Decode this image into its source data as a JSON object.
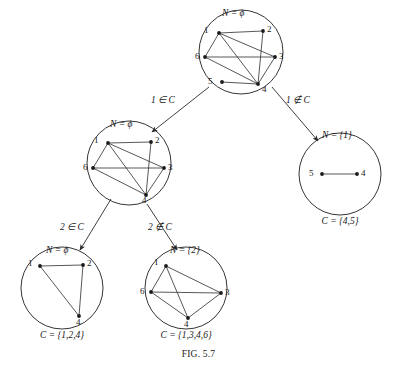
{
  "figure": {
    "caption_prefix": "F",
    "caption_rest": "IG",
    "caption_number": ". 5.7",
    "caption_full": "FIG. 5.7",
    "width": 397,
    "height": 370,
    "ink_color": "#1a1a1a",
    "circle_stroke": "#2a2a2a",
    "edge_color": "#3a3a3a"
  },
  "tree_nodes": [
    {
      "id": "root",
      "name": "root-subproblem",
      "center": [
        241,
        52
      ],
      "radius": 42,
      "n_label": "N = ϕ",
      "n_label_pos": [
        222,
        14
      ],
      "c_label": null,
      "c_label_pos": null,
      "graph": {
        "vertices": [
          {
            "id": "1",
            "pos": [
              219,
              33
            ],
            "label_pos": [
              209,
              30
            ],
            "label_anchor": "right"
          },
          {
            "id": "2",
            "pos": [
              263,
              31
            ],
            "label_pos": [
              267,
              29
            ],
            "label_anchor": "left"
          },
          {
            "id": "3",
            "pos": [
              275,
              57
            ],
            "label_pos": [
              279,
              56
            ],
            "label_anchor": "left"
          },
          {
            "id": "4",
            "pos": [
              258,
              84
            ],
            "label_pos": [
              262,
              89
            ],
            "label_anchor": "left"
          },
          {
            "id": "5",
            "pos": [
              222,
              82
            ],
            "label_pos": [
              213,
              81
            ],
            "label_anchor": "right"
          },
          {
            "id": "6",
            "pos": [
              205,
              57
            ],
            "label_pos": [
              200,
              56
            ],
            "label_anchor": "right"
          }
        ],
        "edges": [
          [
            "1",
            "2"
          ],
          [
            "1",
            "6"
          ],
          [
            "1",
            "4"
          ],
          [
            "1",
            "3"
          ],
          [
            "2",
            "4"
          ],
          [
            "6",
            "3"
          ],
          [
            "6",
            "4"
          ],
          [
            "3",
            "4"
          ],
          [
            "5",
            "4"
          ]
        ]
      }
    },
    {
      "id": "mid-left",
      "name": "subproblem-1-in-c",
      "center": [
        129,
        163
      ],
      "radius": 42,
      "n_label": "N = ϕ",
      "n_label_pos": [
        110,
        125
      ],
      "c_label": null,
      "c_label_pos": null,
      "graph": {
        "vertices": [
          {
            "id": "1",
            "pos": [
              108,
              143
            ],
            "label_pos": [
              99,
              140
            ],
            "label_anchor": "right"
          },
          {
            "id": "2",
            "pos": [
              151,
              142
            ],
            "label_pos": [
              155,
              140
            ],
            "label_anchor": "left"
          },
          {
            "id": "3",
            "pos": [
              164,
              168
            ],
            "label_pos": [
              168,
              167
            ],
            "label_anchor": "left"
          },
          {
            "id": "4",
            "pos": [
              146,
              195
            ],
            "label_pos": [
              142,
              200
            ],
            "label_anchor": "left"
          },
          {
            "id": "6",
            "pos": [
              93,
              168
            ],
            "label_pos": [
              88,
              167
            ],
            "label_anchor": "right"
          }
        ],
        "edges": [
          [
            "1",
            "2"
          ],
          [
            "1",
            "6"
          ],
          [
            "1",
            "4"
          ],
          [
            "1",
            "3"
          ],
          [
            "2",
            "4"
          ],
          [
            "6",
            "3"
          ],
          [
            "6",
            "4"
          ],
          [
            "3",
            "4"
          ]
        ]
      }
    },
    {
      "id": "right",
      "name": "subproblem-1-not-in-c",
      "center": [
        340,
        174
      ],
      "radius": 41,
      "n_label": "N = {1}",
      "n_label_pos": [
        322,
        136
      ],
      "c_label": "C = {4,5}",
      "c_label_pos": [
        340,
        222
      ],
      "graph": {
        "vertices": [
          {
            "id": "5",
            "pos": [
              322,
              174
            ],
            "label_pos": [
              314,
              173
            ],
            "label_anchor": "right"
          },
          {
            "id": "4",
            "pos": [
              357,
              174
            ],
            "label_pos": [
              361,
              173
            ],
            "label_anchor": "left"
          }
        ],
        "edges": [
          [
            "5",
            "4"
          ]
        ]
      }
    },
    {
      "id": "bottom-left",
      "name": "subproblem-2-in-c",
      "center": [
        62,
        288
      ],
      "radius": 41,
      "n_label": "N = ϕ",
      "n_label_pos": [
        46,
        251
      ],
      "c_label": "C = {1,2,4}",
      "c_label_pos": [
        62,
        336
      ],
      "graph": {
        "vertices": [
          {
            "id": "1",
            "pos": [
              40,
              266
            ],
            "label_pos": [
              33,
              263
            ],
            "label_anchor": "right"
          },
          {
            "id": "2",
            "pos": [
              83,
              265
            ],
            "label_pos": [
              87,
              263
            ],
            "label_anchor": "left"
          },
          {
            "id": "4",
            "pos": [
              79,
              316
            ],
            "label_pos": [
              76,
              322
            ],
            "label_anchor": "left"
          }
        ],
        "edges": [
          [
            "1",
            "2"
          ],
          [
            "1",
            "4"
          ],
          [
            "2",
            "4"
          ]
        ]
      }
    },
    {
      "id": "bottom-mid",
      "name": "subproblem-2-not-in-c",
      "center": [
        186,
        288
      ],
      "radius": 41,
      "n_label": "N = {2}",
      "n_label_pos": [
        170,
        251
      ],
      "c_label": "C = {1,3,4,6}",
      "c_label_pos": [
        186,
        336
      ],
      "graph": {
        "vertices": [
          {
            "id": "1",
            "pos": [
              166,
              266
            ],
            "label_pos": [
              159,
              262
            ],
            "label_anchor": "right"
          },
          {
            "id": "3",
            "pos": [
              221,
              293
            ],
            "label_pos": [
              225,
              292
            ],
            "label_anchor": "left"
          },
          {
            "id": "4",
            "pos": [
              188,
              318
            ],
            "label_pos": [
              184,
              324
            ],
            "label_anchor": "left"
          },
          {
            "id": "6",
            "pos": [
              151,
              292
            ],
            "label_pos": [
              145,
              291
            ],
            "label_anchor": "right"
          }
        ],
        "edges": [
          [
            "1",
            "6"
          ],
          [
            "1",
            "3"
          ],
          [
            "1",
            "4"
          ],
          [
            "6",
            "3"
          ],
          [
            "6",
            "4"
          ],
          [
            "3",
            "4"
          ]
        ]
      }
    }
  ],
  "tree_branches": [
    {
      "id": "branch-1-in",
      "name": "branch-1-in-c",
      "label": "1 ∈ C",
      "label_pos": [
        163,
        101
      ],
      "from": [
        209,
        87
      ],
      "to": [
        152,
        132
      ]
    },
    {
      "id": "branch-1-out",
      "name": "branch-1-not-in-c",
      "label": "1 ∉ C",
      "label_pos": [
        298,
        101
      ],
      "from": [
        272,
        87
      ],
      "to": [
        318,
        141
      ]
    },
    {
      "id": "branch-2-in",
      "name": "branch-2-in-c",
      "label": "2 ∈ C",
      "label_pos": [
        72,
        228
      ],
      "from": [
        111,
        199
      ],
      "to": [
        80,
        250
      ]
    },
    {
      "id": "branch-2-out",
      "name": "branch-2-not-in-c",
      "label": "2 ∉ C",
      "label_pos": [
        160,
        228
      ],
      "from": [
        147,
        204
      ],
      "to": [
        177,
        250
      ]
    }
  ]
}
